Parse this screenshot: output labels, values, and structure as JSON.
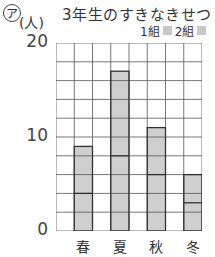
{
  "header": {
    "mark": "ア",
    "unit": "(人)",
    "title": "3年生のすきなきせつ",
    "legend": [
      "1組",
      "2組"
    ]
  },
  "chart_data": {
    "type": "bar",
    "stacked": true,
    "title": "3年生のすきなきせつ",
    "xlabel": "",
    "ylabel": "(人)",
    "categories": [
      "春",
      "夏",
      "秋",
      "冬"
    ],
    "series": [
      {
        "name": "1組",
        "values": [
          4,
          8,
          6,
          3
        ]
      },
      {
        "name": "2組",
        "values": [
          5,
          9,
          5,
          3
        ]
      }
    ],
    "totals": [
      9,
      17,
      11,
      6
    ],
    "ylim": [
      0,
      20
    ],
    "yticks": [
      0,
      10,
      20
    ],
    "grid": true,
    "grid_step": 2,
    "legend_position": "top-right"
  },
  "axis": {
    "y0": "0",
    "y10": "10",
    "y20": "20"
  }
}
